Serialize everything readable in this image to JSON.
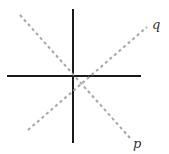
{
  "diagram": {
    "width": 169,
    "height": 154,
    "axes": {
      "color": "#1a1a1a",
      "stroke_width": 2,
      "vertical": {
        "x1": 73,
        "y1": 9,
        "x2": 73,
        "y2": 143
      },
      "horizontal": {
        "x1": 7,
        "y1": 76,
        "x2": 141,
        "y2": 76
      }
    },
    "lines": [
      {
        "name": "p",
        "label": "p",
        "color": "#a6a6a6",
        "dash": "3,3",
        "x1": 20,
        "y1": 15,
        "x2": 130,
        "y2": 138,
        "label_x": 133,
        "label_y": 148
      },
      {
        "name": "q",
        "label": "q",
        "color": "#a6a6a6",
        "dash": "3,3",
        "x1": 28,
        "y1": 130,
        "x2": 147,
        "y2": 27,
        "label_x": 152,
        "label_y": 29
      }
    ]
  }
}
